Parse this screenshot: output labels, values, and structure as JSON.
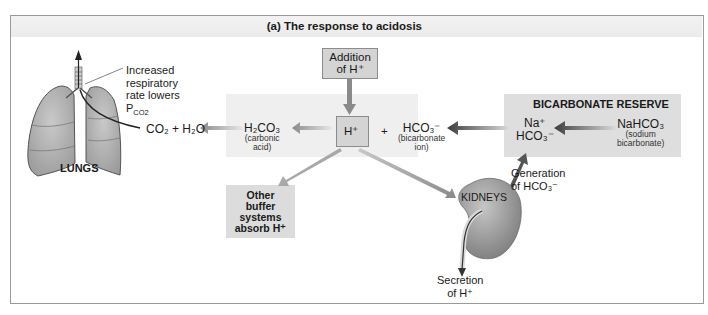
{
  "figure": {
    "title": "(a) The response to acidosis"
  },
  "lungs": {
    "label": "LUNGS",
    "annotation": [
      "Increased",
      "respiratory",
      "rate lowers",
      "P"
    ],
    "annotation_sub": "CO2"
  },
  "reactions": {
    "co2_h2o": "CO₂ + H₂O",
    "h2co3": "H₂CO₃",
    "h2co3_note": [
      "(carbonic",
      "acid)"
    ],
    "h_plus": "H⁺",
    "plus": "+",
    "hco3": "HCO₃⁻",
    "hco3_note": [
      "(bicarbonate",
      "ion)"
    ]
  },
  "addition_box": {
    "lines": [
      "Addition",
      "of H⁺"
    ]
  },
  "bicarbonate_reserve": {
    "title": "BICARBONATE RESERVE",
    "na": "Na⁺",
    "hco3": "HCO₃⁻",
    "nahco3": "NaHCO₃",
    "nahco3_note": [
      "(sodium",
      "bicarbonate)"
    ]
  },
  "other_buffers": {
    "lines": [
      "Other",
      "buffer",
      "systems",
      "absorb H⁺"
    ]
  },
  "kidneys": {
    "label": "KIDNEYS",
    "generation": [
      "Generation",
      "of HCO₃⁻"
    ],
    "secretion": [
      "Secretion",
      "of H⁺"
    ]
  },
  "colors": {
    "shade": "#ececec",
    "box": "#d4d4d4",
    "arrow_gray": "#8a8a8a",
    "arrow_dark": "#555555",
    "kidney": "#9e9e9e"
  }
}
